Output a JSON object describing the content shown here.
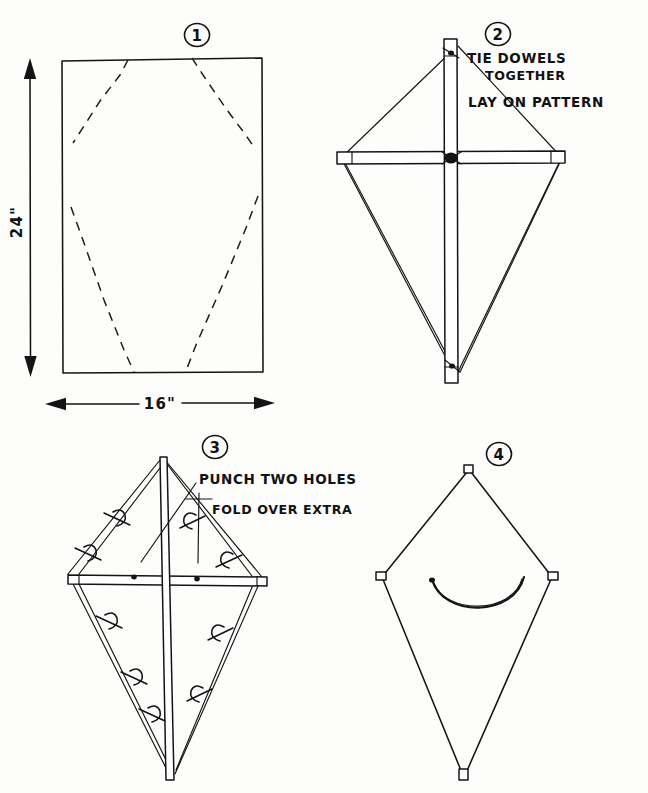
{
  "document": {
    "title": "Kite Construction Instructions",
    "medium": "hand-drawn pen sketch",
    "ink_color": "#141414",
    "paper_color": "#fdfdfc",
    "panel_count": 4
  },
  "panels": [
    {
      "number": "1",
      "name": "cut-pattern",
      "description": "Rectangle of paper with dashed kite-shaped cut lines",
      "dimensions": {
        "height_label": "24\"",
        "width_label": "16\""
      },
      "annotations": []
    },
    {
      "number": "2",
      "name": "tie-dowels",
      "description": "Two dowels crossed and tied, laid on the cut kite pattern",
      "annotations": [
        {
          "id": "note-tie",
          "line1": "TIE DOWELS",
          "line2": "TOGETHER"
        },
        {
          "id": "note-lay",
          "line1": "LAY ON PATTERN"
        }
      ]
    },
    {
      "number": "3",
      "name": "fold-and-string",
      "description": "String run around dowel ends, paper edges folded over and taped",
      "annotations": [
        {
          "id": "note-punch",
          "line1": "PUNCH TWO HOLES"
        },
        {
          "id": "note-fold",
          "line1": "FOLD OVER EXTRA"
        }
      ]
    },
    {
      "number": "4",
      "name": "finished-kite",
      "description": "Completed kite with bridle string attached through the two holes",
      "annotations": []
    }
  ],
  "labels": {
    "height": "24\"",
    "width": "16\"",
    "tie_line_1": "TIE DOWELS",
    "tie_line_2": "TOGETHER",
    "lay_line": "LAY ON PATTERN",
    "punch_line": "PUNCH TWO HOLES",
    "fold_line": "FOLD OVER EXTRA",
    "num_1": "1",
    "num_2": "2",
    "num_3": "3",
    "num_4": "4"
  }
}
